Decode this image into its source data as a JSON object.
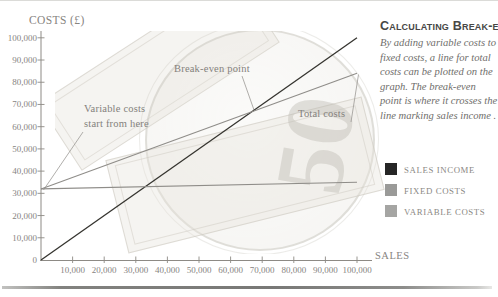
{
  "axis_titles": {
    "y": "COSTS (£)",
    "x": "SALES"
  },
  "panel": {
    "title": "Calculating Break-even",
    "body_lines": [
      "By adding variable costs to",
      "fixed costs, a line for total",
      "costs can be plotted on the",
      "graph.  The break-even",
      "point is where it crosses the",
      "line marking sales income ."
    ]
  },
  "legend": {
    "items": [
      {
        "label": "SALES INCOME",
        "color": "#262626"
      },
      {
        "label": "FIXED COSTS",
        "color": "#9a9a98"
      },
      {
        "label": "VARIABLE COSTS",
        "color": "#a5a5a3"
      }
    ]
  },
  "annotations": {
    "break_even": "Break-even point",
    "variable_costs_line1": "Variable costs",
    "variable_costs_line2": "start from here",
    "total_costs": "Total costs"
  },
  "background": {
    "watermark_numeral": "50"
  },
  "chart_data": {
    "type": "line",
    "title": "Calculating Break-even",
    "xlabel": "SALES",
    "ylabel": "COSTS (£)",
    "xlim": [
      0,
      100000
    ],
    "ylim": [
      0,
      100000
    ],
    "x_ticks": [
      10000,
      20000,
      30000,
      40000,
      50000,
      60000,
      70000,
      80000,
      90000,
      100000
    ],
    "y_ticks": [
      0,
      10000,
      20000,
      30000,
      40000,
      50000,
      60000,
      70000,
      80000,
      90000,
      100000
    ],
    "grid": false,
    "legend_position": "right",
    "series": [
      {
        "name": "Sales income",
        "color": "#35342f",
        "stroke_width": 1.3,
        "points": [
          [
            0,
            0
          ],
          [
            100000,
            100000
          ]
        ]
      },
      {
        "name": "Total costs (fixed + variable)",
        "color": "#8f8d89",
        "stroke_width": 1.1,
        "points": [
          [
            0,
            32000
          ],
          [
            100000,
            84000
          ]
        ]
      },
      {
        "name": "Fixed costs",
        "color": "#8f8d89",
        "stroke_width": 1.1,
        "points": [
          [
            0,
            32000
          ],
          [
            100000,
            35000
          ]
        ]
      }
    ],
    "break_even_point": {
      "sales": 67000,
      "costs": 67000
    }
  }
}
